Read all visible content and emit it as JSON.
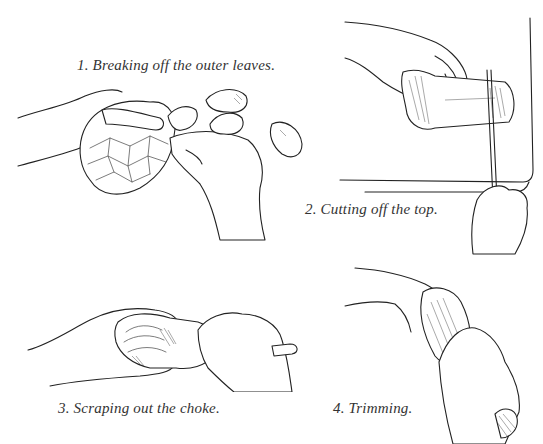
{
  "figure": {
    "steps": [
      {
        "number": "1.",
        "caption": "1. Breaking off the outer leaves.",
        "illustration": "hands-breaking-artichoke-leaves"
      },
      {
        "number": "2.",
        "caption": "2. Cutting off the top.",
        "illustration": "hand-cutting-artichoke-top-with-knife"
      },
      {
        "number": "3.",
        "caption": "3. Scraping out the choke.",
        "illustration": "hands-scraping-artichoke-choke-with-spoon"
      },
      {
        "number": "4.",
        "caption": "4. Trimming.",
        "illustration": "hands-trimming-artichoke-with-knife"
      }
    ]
  }
}
